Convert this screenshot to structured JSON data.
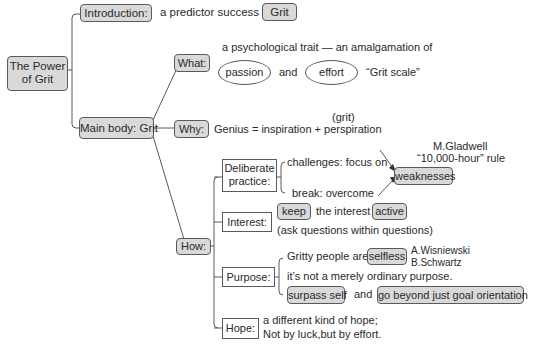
{
  "root": {
    "label": "The Power\nof Grit",
    "line1": "The Power",
    "line2": "of Grit"
  },
  "introduction": {
    "label": "Introduction:",
    "text": "a predictor success —",
    "highlight": "Grit"
  },
  "main_body": {
    "label": "Main body: Grit",
    "what": {
      "label": "What:",
      "description": "a psychological trait — an amalgamation of",
      "oval1": "passion",
      "connector": "and",
      "oval2": "effort",
      "note": "“Grit scale”"
    },
    "why": {
      "label": "Why:",
      "annotation": "(grit)",
      "formula": "Genius = inspiration + perspiration"
    },
    "how": {
      "label": "How:",
      "deliberate_practice": {
        "label_line1": "Deliberate",
        "label_line2": "practice:",
        "challenges": "challenges: focus on",
        "break": "break: overcome",
        "target": "weaknesses",
        "source_line1": "M.Gladwell",
        "source_line2": "“10,000-hour” rule"
      },
      "interest": {
        "label": "Interest:",
        "keep": "keep",
        "middle": "the interest",
        "active": "active",
        "note": "(ask questions within questions)"
      },
      "purpose": {
        "label": "Purpose:",
        "line1_text": "Gritty people are",
        "selfless": "selfless",
        "author1": "A.Wisniewski",
        "author2": "B.Schwartz",
        "line2": "it’s not a merely ordinary purpose.",
        "surpass": "surpass self",
        "connector": "and",
        "beyond": "go beyond just goal orientation"
      },
      "hope": {
        "label": "Hope:",
        "line1": "a different kind of hope;",
        "line2": "Not by luck,but by effort."
      }
    }
  },
  "colors": {
    "node_fill": "#d9d9d9",
    "line": "#5a5a5a",
    "text": "#2a2a2a"
  }
}
